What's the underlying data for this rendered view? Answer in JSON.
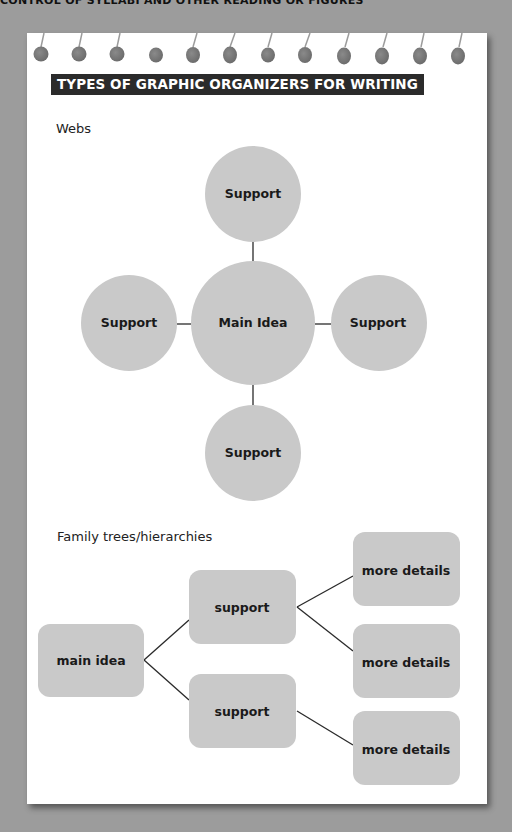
{
  "page": {
    "top_text_partial": "CONTROL OF SYLLABI AND OTHER READING OR FIGURES",
    "background_color": "#9c9c9c",
    "paper_color": "#ffffff",
    "shape_fill_color": "#c9c9c9",
    "header_color": "#2b2b2b"
  },
  "header": {
    "title": "TYPES OF GRAPHIC ORGANIZERS FOR WRITING"
  },
  "webs": {
    "label": "Webs",
    "center": {
      "label": "Main Idea"
    },
    "nodes": [
      {
        "position": "top",
        "label": "Support"
      },
      {
        "position": "left",
        "label": "Support"
      },
      {
        "position": "right",
        "label": "Support"
      },
      {
        "position": "bottom",
        "label": "Support"
      }
    ]
  },
  "hierarchy": {
    "label": "Family trees/hierarchies",
    "root": {
      "label": "main idea"
    },
    "supports": [
      {
        "label": "support",
        "children": [
          {
            "label": "more details"
          },
          {
            "label": "more details"
          }
        ]
      },
      {
        "label": "support",
        "children": [
          {
            "label": "more details"
          }
        ]
      }
    ]
  }
}
